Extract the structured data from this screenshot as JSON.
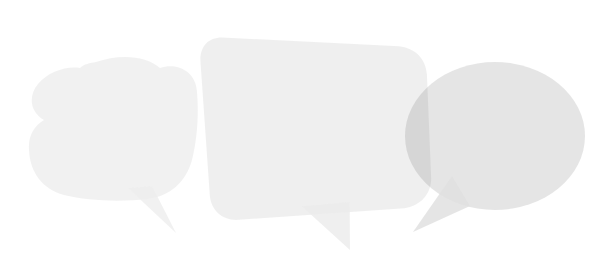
{
  "canvas": {
    "width": 615,
    "height": 276,
    "background_color": "#ffffff",
    "description": "Decorative graphic of three overlapping translucent light-gray speech bubbles"
  },
  "palette": {
    "background": "#ffffff",
    "bubble_left_fill": "#efefef",
    "bubble_middle_fill": "#ececec",
    "bubble_right_fill": "#e0e0e0",
    "overlap_light": "#e6e6e6",
    "overlap_dark": "#cfcfcf"
  },
  "bubbles": [
    {
      "id": "left",
      "name": "speech-bubble-left",
      "shape": "cloud-rounded-blob",
      "fill": "#efefef",
      "opacity": 0.85,
      "bounds": {
        "x": 28,
        "y": 58,
        "width": 169,
        "height": 142
      },
      "tail": {
        "direction": "down-right",
        "apex_x": 176,
        "apex_y": 233
      },
      "z_index": 1
    },
    {
      "id": "middle",
      "name": "speech-bubble-middle",
      "shape": "rounded-rectangle-rotated",
      "fill": "#ececec",
      "opacity": 0.85,
      "rotation_deg": -4,
      "bounds": {
        "x": 205,
        "y": 30,
        "width": 227,
        "height": 185
      },
      "tail": {
        "direction": "down",
        "apex_x": 341,
        "apex_y": 252
      },
      "z_index": 2
    },
    {
      "id": "right",
      "name": "speech-bubble-right",
      "shape": "ellipse",
      "fill": "#e0e0e0",
      "opacity": 0.85,
      "bounds": {
        "x": 405,
        "y": 62,
        "width": 180,
        "height": 148
      },
      "tail": {
        "direction": "down-left",
        "apex_x": 413,
        "apex_y": 232
      },
      "z_index": 3
    }
  ]
}
